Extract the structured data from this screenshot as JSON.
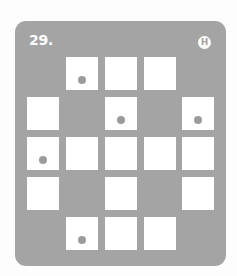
{
  "puzzle": {
    "number_label": "29.",
    "difficulty_badge": "H",
    "colors": {
      "panel": "#a4a4a4",
      "cell": "#ffffff",
      "dot": "#9b9b9b"
    },
    "grid": {
      "rows": 5,
      "cols": 5,
      "cells": [
        [
          null,
          "dot",
          "empty",
          "empty",
          null
        ],
        [
          "empty",
          null,
          "dot",
          null,
          "dot"
        ],
        [
          "dot",
          "empty",
          "empty",
          "empty",
          "empty"
        ],
        [
          "empty",
          null,
          "empty",
          null,
          "empty"
        ],
        [
          null,
          "dot",
          "empty",
          "empty",
          null
        ]
      ]
    }
  }
}
